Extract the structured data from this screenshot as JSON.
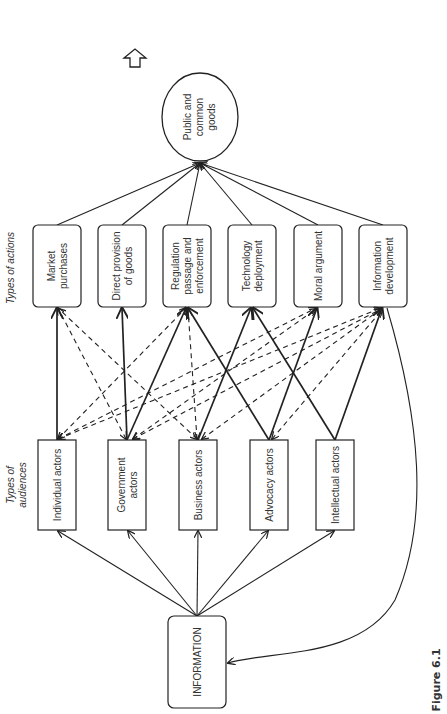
{
  "figure": {
    "caption": "Figure 6.1",
    "orientation": "rotated-90-ccw",
    "row_labels": {
      "actions": "Types of actions",
      "audiences_line1": "Types of",
      "audiences_line2": "audiences"
    },
    "goal": {
      "line1": "Public and",
      "line2": "common",
      "line3": "goods"
    },
    "source": {
      "label": "INFORMATION"
    },
    "actions": [
      {
        "id": "market",
        "line1": "Market",
        "line2": "purchases",
        "line3": ""
      },
      {
        "id": "direct",
        "line1": "Direct provision",
        "line2": "of goods",
        "line3": ""
      },
      {
        "id": "regulation",
        "line1": "Regulation",
        "line2": "passage and",
        "line3": "enforcement"
      },
      {
        "id": "technology",
        "line1": "Technology",
        "line2": "deployment",
        "line3": ""
      },
      {
        "id": "moral",
        "line1": "Moral argument",
        "line2": "",
        "line3": ""
      },
      {
        "id": "infodev",
        "line1": "Information",
        "line2": "development",
        "line3": ""
      }
    ],
    "audiences": [
      {
        "id": "individual",
        "line1": "Individual actors",
        "line2": ""
      },
      {
        "id": "government",
        "line1": "Government",
        "line2": "actors"
      },
      {
        "id": "business",
        "line1": "Business actors",
        "line2": ""
      },
      {
        "id": "advocacy",
        "line1": "Advocacy actors",
        "line2": ""
      },
      {
        "id": "intellectual",
        "line1": "Intellectual actors",
        "line2": ""
      }
    ],
    "edges_solid": [
      [
        "individual",
        "market"
      ],
      [
        "government",
        "direct"
      ],
      [
        "government",
        "regulation"
      ],
      [
        "business",
        "technology"
      ],
      [
        "advocacy",
        "regulation"
      ],
      [
        "advocacy",
        "moral"
      ],
      [
        "intellectual",
        "technology"
      ],
      [
        "intellectual",
        "infodev"
      ]
    ],
    "edges_dashed": [
      [
        "individual",
        "regulation"
      ],
      [
        "individual",
        "moral"
      ],
      [
        "individual",
        "infodev"
      ],
      [
        "government",
        "market"
      ],
      [
        "government",
        "moral"
      ],
      [
        "government",
        "infodev"
      ],
      [
        "business",
        "market"
      ],
      [
        "business",
        "regulation"
      ],
      [
        "business",
        "infodev"
      ],
      [
        "advocacy",
        "infodev"
      ]
    ],
    "colors": {
      "line": "#222222",
      "background": "#ffffff"
    }
  }
}
